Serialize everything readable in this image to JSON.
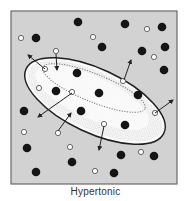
{
  "caption": "Hypertonic",
  "colors": {
    "background": "#d2d2d2",
    "frame": "#6a6a6a",
    "cell_fill": "#fafafa",
    "cell_outline": "#1e1e1e",
    "stipple": "#777777",
    "solute": "#151515",
    "water": "#ffffff",
    "water_outline": "#555555",
    "arrow": "#222222"
  },
  "frame": {
    "x": 11,
    "y": 11,
    "w": 166,
    "h": 173
  },
  "cell": {
    "cx": 95,
    "cy": 101,
    "rx": 76,
    "ry": 32,
    "rotation": 25
  },
  "inner_vacuole": {
    "cx": 94,
    "cy": 88,
    "rx": 55,
    "ry": 14,
    "rotation": 22
  },
  "solute_particles": [
    {
      "x": 78,
      "y": 22
    },
    {
      "x": 125,
      "y": 24
    },
    {
      "x": 162,
      "y": 27
    },
    {
      "x": 36,
      "y": 38
    },
    {
      "x": 102,
      "y": 47
    },
    {
      "x": 142,
      "y": 51
    },
    {
      "x": 165,
      "y": 47
    },
    {
      "x": 164,
      "y": 70
    },
    {
      "x": 77,
      "y": 73
    },
    {
      "x": 56,
      "y": 91
    },
    {
      "x": 99,
      "y": 93
    },
    {
      "x": 138,
      "y": 95
    },
    {
      "x": 81,
      "y": 111
    },
    {
      "x": 24,
      "y": 111
    },
    {
      "x": 125,
      "y": 125
    },
    {
      "x": 27,
      "y": 148
    },
    {
      "x": 72,
      "y": 162
    },
    {
      "x": 121,
      "y": 155
    },
    {
      "x": 154,
      "y": 156
    },
    {
      "x": 36,
      "y": 172
    },
    {
      "x": 114,
      "y": 173
    }
  ],
  "water_molecules": [
    {
      "x": 21,
      "y": 38
    },
    {
      "x": 93,
      "y": 37
    },
    {
      "x": 147,
      "y": 29
    },
    {
      "x": 56,
      "y": 51
    },
    {
      "x": 154,
      "y": 57
    },
    {
      "x": 45,
      "y": 69
    },
    {
      "x": 123,
      "y": 81
    },
    {
      "x": 39,
      "y": 88
    },
    {
      "x": 72,
      "y": 92
    },
    {
      "x": 155,
      "y": 113
    },
    {
      "x": 104,
      "y": 124
    },
    {
      "x": 24,
      "y": 132
    },
    {
      "x": 58,
      "y": 133
    },
    {
      "x": 70,
      "y": 147
    },
    {
      "x": 141,
      "y": 152
    },
    {
      "x": 95,
      "y": 171
    }
  ],
  "arrows": [
    {
      "label": "water-out-top-left",
      "x1": 45,
      "y1": 69,
      "x2": 28,
      "y2": 55
    },
    {
      "label": "water-in-top",
      "x1": 56,
      "y1": 54,
      "x2": 57,
      "y2": 70
    },
    {
      "label": "water-out-top-right",
      "x1": 124,
      "y1": 80,
      "x2": 131,
      "y2": 60
    },
    {
      "label": "water-out-left",
      "x1": 72,
      "y1": 93,
      "x2": 38,
      "y2": 117
    },
    {
      "label": "water-in-bottom-left",
      "x1": 58,
      "y1": 131,
      "x2": 71,
      "y2": 113
    },
    {
      "label": "water-out-bottom",
      "x1": 104,
      "y1": 126,
      "x2": 99,
      "y2": 150
    },
    {
      "label": "water-out-right",
      "x1": 155,
      "y1": 113,
      "x2": 173,
      "y2": 100
    }
  ],
  "legend_semantics": {
    "solute_particles": "filled black dots",
    "water_molecules": "open circles",
    "arrows": "direction of water movement (net outflow from cell)"
  }
}
